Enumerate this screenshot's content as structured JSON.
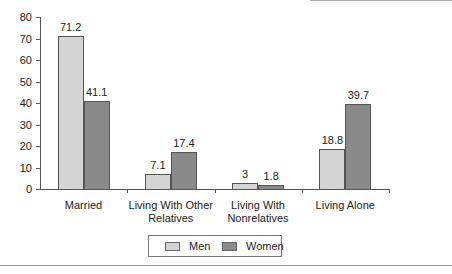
{
  "chart_data": {
    "type": "bar",
    "title": "",
    "xlabel": "",
    "ylabel": "",
    "ylim": [
      0,
      80
    ],
    "yticks": [
      0,
      10,
      20,
      30,
      40,
      50,
      60,
      70,
      80
    ],
    "categories": [
      "Married",
      "Living With Other Relatives",
      "Living With Nonrelatives",
      "Living Alone"
    ],
    "category_lines": [
      [
        "Married"
      ],
      [
        "Living With Other",
        "Relatives"
      ],
      [
        "Living With",
        "Nonrelatives"
      ],
      [
        "Living Alone"
      ]
    ],
    "series": [
      {
        "name": "Men",
        "values": [
          71.2,
          7.1,
          3,
          18.8
        ],
        "labels": [
          "71.2",
          "7.1",
          "3",
          "18.8"
        ],
        "color": "#d4d4d4"
      },
      {
        "name": "Women",
        "values": [
          41.1,
          17.4,
          1.8,
          39.7
        ],
        "labels": [
          "41.1",
          "17.4",
          "1.8",
          "39.7"
        ],
        "color": "#8a8a8a"
      }
    ],
    "legend": {
      "position": "bottom",
      "items": [
        "Men",
        "Women"
      ]
    },
    "grid": false
  }
}
